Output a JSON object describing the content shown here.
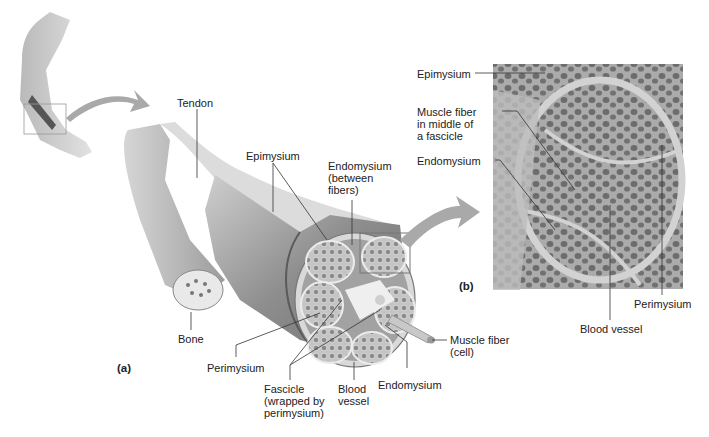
{
  "figure": {
    "panel_a": {
      "label": "(a)",
      "labels": {
        "tendon": "Tendon",
        "epimysium": "Epimysium",
        "endomysium_between": "Endomysium\n(between\nfibers)",
        "bone": "Bone",
        "perimysium": "Perimysium",
        "fascicle": "Fascicle\n(wrapped by\nperimysium)",
        "blood_vessel": "Blood\nvessel",
        "endomysium": "Endomysium",
        "muscle_fiber": "Muscle fiber\n(cell)"
      }
    },
    "panel_b": {
      "label": "(b)",
      "labels": {
        "epimysium": "Epimysium",
        "muscle_fiber_middle": "Muscle fiber\nin middle of\na fascicle",
        "endomysium": "Endomysium",
        "perimysium": "Perimysium",
        "blood_vessel": "Blood vessel"
      }
    },
    "colors": {
      "arrow": "#a9a9a9",
      "muscle": "#8c8c8c",
      "micrograph_bg": "#b8b8b8",
      "fiber": "#5a5a5a",
      "leader_line": "#333333"
    }
  }
}
